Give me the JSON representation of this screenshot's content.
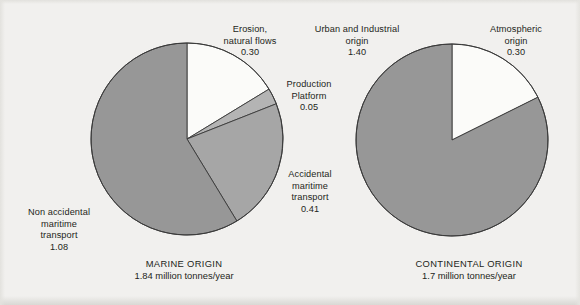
{
  "figure": {
    "background_color": "#f1f0ee",
    "text_color": "#231f20"
  },
  "palette": {
    "slice_dark_gray": "#979797",
    "slice_mid_gray": "#a6a6a6",
    "slice_light_gray": "#b4b4b4",
    "slice_white": "#fbfbf9",
    "slice_outline": "#3a3a3a"
  },
  "panels": {
    "marine": {
      "caption_title": "MARINE ORIGIN",
      "caption_subtitle": "1.84 million tonnes/year",
      "callouts": {
        "erosion": {
          "label": "Erosion,\nnatural flows",
          "value": "0.30"
        },
        "production": {
          "label": "Production\nPlatform",
          "value": "0.05"
        },
        "accidental": {
          "label": "Accidental\nmaritime\ntransport",
          "value": "0.41"
        },
        "non_accidental": {
          "label": "Non accidental\nmaritime\ntransport",
          "value": "1.08"
        }
      }
    },
    "continental": {
      "caption_title": "CONTINENTAL ORIGIN",
      "caption_subtitle": "1.7 million tonnes/year",
      "callouts": {
        "urban": {
          "label": "Urban and Industrial\norigin",
          "value": "1.40"
        },
        "atmospheric": {
          "label": "Atmospheric\norigin",
          "value": "0.30"
        }
      }
    }
  },
  "chart_data": [
    {
      "type": "pie",
      "title": "MARINE ORIGIN",
      "subtitle": "1.84 million tonnes/year",
      "unit": "million tonnes/year",
      "total": 1.84,
      "start_angle_deg": 0,
      "direction": "clockwise",
      "categories": [
        "Erosion, natural flows",
        "Production Platform",
        "Accidental maritime transport",
        "Non accidental maritime transport"
      ],
      "values": [
        0.3,
        0.05,
        0.41,
        1.08
      ],
      "percentages": [
        16.3,
        2.7,
        22.3,
        58.7
      ],
      "colors": [
        "#fbfbf9",
        "#b4b4b4",
        "#a6a6a6",
        "#979797"
      ],
      "legend": "callout labels around pie",
      "grid": false
    },
    {
      "type": "pie",
      "title": "CONTINENTAL ORIGIN",
      "subtitle": "1.7 million tonnes/year",
      "unit": "million tonnes/year",
      "total": 1.7,
      "start_angle_deg": 0,
      "direction": "clockwise",
      "categories": [
        "Atmospheric origin",
        "Urban and Industrial origin"
      ],
      "values": [
        0.3,
        1.4
      ],
      "percentages": [
        17.6,
        82.4
      ],
      "colors": [
        "#fbfbf9",
        "#979797"
      ],
      "legend": "callout labels around pie",
      "grid": false
    }
  ]
}
